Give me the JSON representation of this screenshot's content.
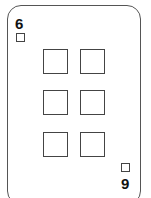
{
  "card": {
    "rank": "6",
    "rank_inverted_display": "9",
    "suit_icon": "square-icon",
    "pip_count": 6,
    "border_color": "#555555",
    "pip_color": "#444444"
  }
}
